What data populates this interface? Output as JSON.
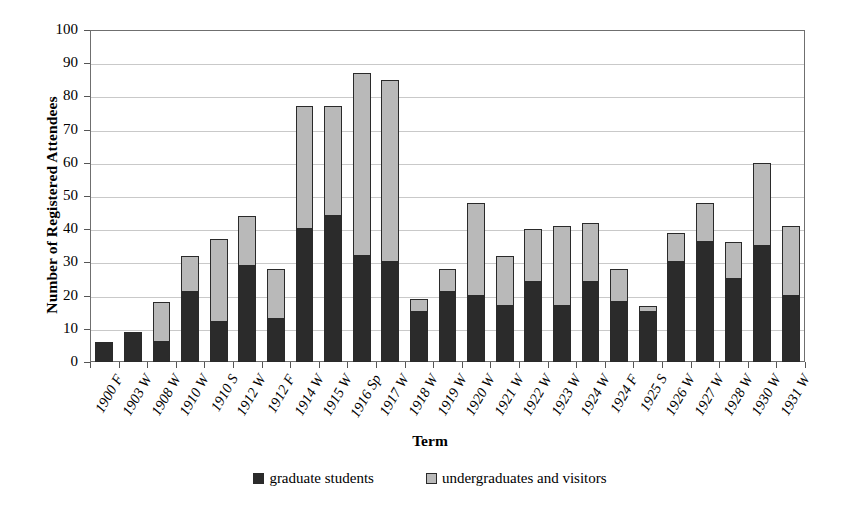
{
  "chart_data": {
    "type": "bar",
    "stacked": true,
    "title": "",
    "xlabel": "Term",
    "ylabel": "Number of Registered Attendees",
    "ylim": [
      0,
      100
    ],
    "ytick_step": 10,
    "yticks": [
      "100",
      "90",
      "80",
      "70",
      "60",
      "50",
      "40",
      "30",
      "20",
      "10",
      "0"
    ],
    "grid": true,
    "grid_axis": "y",
    "legend_position": "bottom",
    "categories": [
      "1900 F",
      "1903 W",
      "1908 W",
      "1910 W",
      "1910 S",
      "1912 W",
      "1912 F",
      "1914 W",
      "1915 W",
      "1916 Sp",
      "1917 W",
      "1918 W",
      "1919 W",
      "1920 W",
      "1921 W",
      "1922 W",
      "1923 W",
      "1924 W",
      "1924 F",
      "1925 S",
      "1926 W",
      "1927 W",
      "1928 W",
      "1930 W",
      "1931 W"
    ],
    "series": [
      {
        "name": "graduate students",
        "color": "#2b2b2b",
        "values": [
          6,
          9,
          6,
          21,
          12,
          29,
          13,
          40,
          44,
          32,
          30,
          15,
          21,
          20,
          17,
          24,
          17,
          24,
          18,
          15,
          30,
          36,
          25,
          35,
          20
        ]
      },
      {
        "name": "undergraduates and visitors",
        "color": "#b9b9b9",
        "values": [
          0,
          0,
          12,
          11,
          25,
          15,
          15,
          37,
          33,
          55,
          55,
          4,
          7,
          28,
          15,
          16,
          24,
          18,
          10,
          2,
          9,
          12,
          11,
          25,
          21
        ]
      }
    ],
    "totals": [
      6,
      9,
      18,
      32,
      37,
      44,
      28,
      77,
      77,
      87,
      85,
      19,
      28,
      48,
      32,
      40,
      41,
      42,
      28,
      17,
      39,
      48,
      36,
      60,
      41
    ]
  },
  "legend": {
    "items": [
      {
        "label": "graduate students",
        "swatch": "dark-swatch"
      },
      {
        "label": "undergraduates and visitors",
        "swatch": "light-swatch"
      }
    ]
  }
}
